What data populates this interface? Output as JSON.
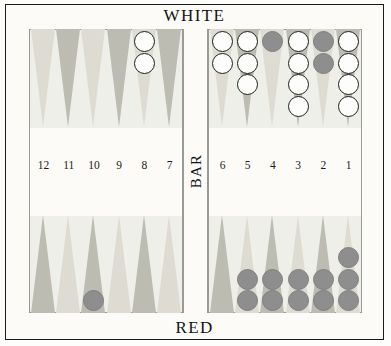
{
  "board": {
    "top_player_label": "WHITE",
    "bottom_player_label": "RED",
    "bar_label": "BAR",
    "colors": {
      "frame": "#1b1b1b",
      "surface": "#efefe9",
      "point_light": "#dedcd2",
      "point_dark": "#bcbcb2",
      "white_checker": "#fdfdfb",
      "white_checker_border": "#1e1e1e",
      "red_checker": "#8e8e8e",
      "background": "#fcfbf8"
    },
    "point_numbers": {
      "left_quadrant": [
        "12",
        "11",
        "10",
        "9",
        "8",
        "7"
      ],
      "right_quadrant": [
        "6",
        "5",
        "4",
        "3",
        "2",
        "1"
      ]
    },
    "quadrants": {
      "top_left": {
        "label": "top-left-quadrant",
        "points": [
          {
            "number": "12",
            "shade": "light",
            "checkers": 0,
            "color": ""
          },
          {
            "number": "11",
            "shade": "dark",
            "checkers": 0,
            "color": ""
          },
          {
            "number": "10",
            "shade": "light",
            "checkers": 0,
            "color": ""
          },
          {
            "number": "9",
            "shade": "dark",
            "checkers": 0,
            "color": ""
          },
          {
            "number": "8",
            "shade": "light",
            "checkers": 2,
            "color": "white"
          },
          {
            "number": "7",
            "shade": "dark",
            "checkers": 0,
            "color": ""
          }
        ]
      },
      "top_right": {
        "label": "top-right-quadrant",
        "points": [
          {
            "number": "6",
            "shade": "light",
            "checkers": 2,
            "color": "white"
          },
          {
            "number": "5",
            "shade": "dark",
            "checkers": 3,
            "color": "white"
          },
          {
            "number": "4",
            "shade": "light",
            "checkers": 1,
            "color": "red"
          },
          {
            "number": "3",
            "shade": "dark",
            "checkers": 4,
            "color": "white"
          },
          {
            "number": "2",
            "shade": "light",
            "checkers": 2,
            "color": "red"
          },
          {
            "number": "1",
            "shade": "dark",
            "checkers": 4,
            "color": "white"
          }
        ]
      },
      "bottom_left": {
        "label": "bottom-left-quadrant",
        "points": [
          {
            "number": "12",
            "shade": "dark",
            "checkers": 0,
            "color": ""
          },
          {
            "number": "11",
            "shade": "light",
            "checkers": 0,
            "color": ""
          },
          {
            "number": "10",
            "shade": "dark",
            "checkers": 1,
            "color": "red"
          },
          {
            "number": "9",
            "shade": "light",
            "checkers": 0,
            "color": ""
          },
          {
            "number": "8",
            "shade": "dark",
            "checkers": 0,
            "color": ""
          },
          {
            "number": "7",
            "shade": "light",
            "checkers": 0,
            "color": ""
          }
        ]
      },
      "bottom_right": {
        "label": "bottom-right-quadrant",
        "points": [
          {
            "number": "6",
            "shade": "dark",
            "checkers": 0,
            "color": ""
          },
          {
            "number": "5",
            "shade": "light",
            "checkers": 2,
            "color": "red"
          },
          {
            "number": "4",
            "shade": "dark",
            "checkers": 2,
            "color": "red"
          },
          {
            "number": "3",
            "shade": "light",
            "checkers": 2,
            "color": "red"
          },
          {
            "number": "2",
            "shade": "dark",
            "checkers": 2,
            "color": "red"
          },
          {
            "number": "1",
            "shade": "light",
            "checkers": 3,
            "color": "red"
          }
        ]
      }
    },
    "totals": {
      "white_on_board": 17,
      "red_on_board": 12
    }
  }
}
